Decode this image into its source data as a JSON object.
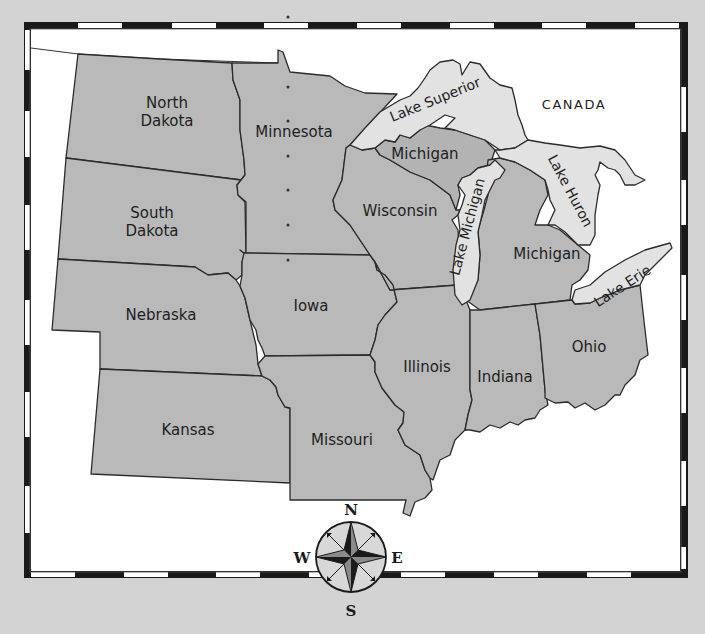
{
  "map": {
    "title": "Midwest United States",
    "colors": {
      "background": "#d3d3d3",
      "map_area": "#ffffff",
      "state_fill": "#b9b9b9",
      "lake_fill": "#e2e2e2",
      "outline": "#2b2b2b",
      "border_dark": "#1a1a1a",
      "border_light": "#ffffff"
    },
    "country_label": "CANADA",
    "states": [
      {
        "id": "north-dakota",
        "line1": "North",
        "line2": "Dakota"
      },
      {
        "id": "south-dakota",
        "line1": "South",
        "line2": "Dakota"
      },
      {
        "id": "nebraska",
        "line1": "Nebraska"
      },
      {
        "id": "kansas",
        "line1": "Kansas"
      },
      {
        "id": "minnesota",
        "line1": "Minnesota"
      },
      {
        "id": "iowa",
        "line1": "Iowa"
      },
      {
        "id": "missouri",
        "line1": "Missouri"
      },
      {
        "id": "wisconsin",
        "line1": "Wisconsin"
      },
      {
        "id": "illinois",
        "line1": "Illinois"
      },
      {
        "id": "michigan-upper",
        "line1": "Michigan"
      },
      {
        "id": "michigan-lower",
        "line1": "Michigan"
      },
      {
        "id": "indiana",
        "line1": "Indiana"
      },
      {
        "id": "ohio",
        "line1": "Ohio"
      }
    ],
    "lakes": [
      {
        "id": "lake-superior",
        "label": "Lake Superior"
      },
      {
        "id": "lake-michigan",
        "label": "Lake Michigan"
      },
      {
        "id": "lake-huron",
        "label": "Lake Huron"
      },
      {
        "id": "lake-erie",
        "label": "Lake Erie"
      }
    ],
    "compass": {
      "north": "N",
      "south": "S",
      "east": "E",
      "west": "W"
    }
  }
}
